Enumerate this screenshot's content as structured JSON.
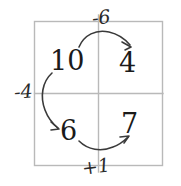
{
  "diagram": {
    "title_visible": false,
    "background_color": "#ffffff",
    "ink_color": "#1a1a1a",
    "grid_line_color": "#b8b8b8",
    "box": {
      "name": "two-by-two-grid",
      "x": 34,
      "y": 21,
      "width": 129,
      "height": 145,
      "divider_vertical_x": 98,
      "divider_horizontal_y": 93
    },
    "cells": [
      {
        "position": "top-left",
        "value": "10"
      },
      {
        "position": "top-right",
        "value": "4"
      },
      {
        "position": "bottom-left",
        "value": "6"
      },
      {
        "position": "bottom-right",
        "value": "7"
      }
    ],
    "operations": [
      {
        "position": "top",
        "label": "-6",
        "from": "10",
        "to": "4"
      },
      {
        "position": "left",
        "label": "-4",
        "from": "10",
        "to": "6"
      },
      {
        "position": "bottom",
        "label": "+1",
        "from": "6",
        "to": "7"
      }
    ],
    "arrows": [
      {
        "name": "arrow-top-left-to-top-right",
        "direction": "left-to-right",
        "curve": "arc-up"
      },
      {
        "name": "arrow-top-left-to-bottom-left",
        "direction": "top-to-bottom",
        "curve": "arc-left"
      },
      {
        "name": "arrow-bottom-left-to-bottom-right",
        "direction": "left-to-right",
        "curve": "arc-down"
      }
    ]
  }
}
